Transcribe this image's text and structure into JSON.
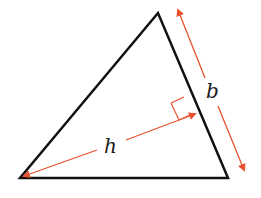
{
  "diagram": {
    "labels": {
      "height": "h",
      "base": "b"
    },
    "colors": {
      "triangle_stroke": "#111111",
      "annotation": "#e8522f",
      "background": "#ffffff"
    },
    "vertices": {
      "top": [
        158,
        13
      ],
      "bottom_left": [
        20,
        178
      ],
      "bottom_right": [
        228,
        178
      ]
    }
  }
}
